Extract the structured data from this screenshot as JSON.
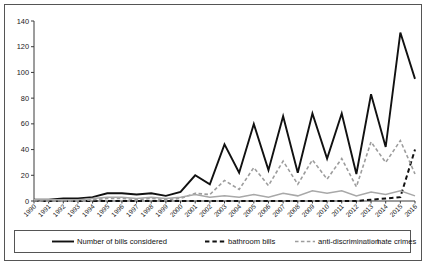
{
  "chart_data": {
    "type": "line",
    "title": "",
    "subtitle": "",
    "xlabel": "",
    "ylabel": "",
    "grid": false,
    "legend_position": "bottom",
    "ylim": [
      0,
      140
    ],
    "yticks": [
      0,
      20,
      40,
      60,
      80,
      100,
      120,
      140
    ],
    "ytick_labels": [
      "0",
      "20",
      "40",
      "60",
      "80",
      "100",
      "120",
      "140"
    ],
    "categories": [
      "1990",
      "1991",
      "1992",
      "1993",
      "1994",
      "1995",
      "1996",
      "1997",
      "1998",
      "1999",
      "2000",
      "2001",
      "2002",
      "2003",
      "2004",
      "2005",
      "2006",
      "2007",
      "2008",
      "2009",
      "2010",
      "2011",
      "2012",
      "2013",
      "2014",
      "2015",
      "2016"
    ],
    "series": [
      {
        "name": "Number of bills considered",
        "color": "#111111",
        "style": "solid",
        "width": 1.9,
        "values": [
          1,
          1,
          2,
          2,
          3,
          6,
          6,
          5,
          6,
          4,
          7,
          20,
          13,
          44,
          22,
          60,
          24,
          66,
          22,
          68,
          33,
          68,
          21,
          83,
          42,
          131,
          95
        ]
      },
      {
        "name": "bathroom bills",
        "color": "#111111",
        "style": "dashed",
        "width": 2.0,
        "values": [
          0,
          0,
          0,
          0,
          0,
          0,
          0,
          0,
          0,
          0,
          0,
          0,
          0,
          0,
          0,
          0,
          0,
          0,
          0,
          0,
          0,
          0,
          0,
          1,
          2,
          3,
          40
        ]
      },
      {
        "name": "anti-discrimination",
        "color": "#9d9d9d",
        "style": "dashed",
        "width": 1.6,
        "values": [
          0,
          0,
          0,
          0,
          1,
          2,
          2,
          1,
          2,
          1,
          2,
          6,
          5,
          16,
          9,
          26,
          12,
          31,
          13,
          32,
          17,
          33,
          11,
          46,
          30,
          47,
          21
        ]
      },
      {
        "name": "hate crimes",
        "color": "#a8a8a8",
        "style": "solid",
        "width": 1.5,
        "values": [
          1,
          1,
          1,
          1,
          2,
          3,
          3,
          2,
          3,
          2,
          3,
          5,
          3,
          4,
          3,
          5,
          3,
          6,
          4,
          8,
          6,
          8,
          4,
          7,
          5,
          8,
          4
        ]
      }
    ]
  },
  "legend": {
    "items": [
      {
        "label": "Number of bills considered"
      },
      {
        "label": "bathroom bills"
      },
      {
        "label": "anti-discrimination"
      },
      {
        "label": "hate crimes"
      }
    ]
  }
}
